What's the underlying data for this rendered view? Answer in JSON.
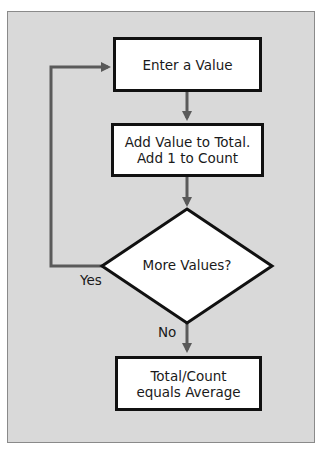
{
  "diagram": {
    "type": "flowchart",
    "colors": {
      "background": "#d9d9d9",
      "node_fill": "#ffffff",
      "node_border": "#111111",
      "arrow": "#5a5a5a",
      "text": "#1a1a1a"
    },
    "nodes": [
      {
        "id": "enter",
        "shape": "rectangle",
        "label": "Enter a Value"
      },
      {
        "id": "add",
        "shape": "rectangle",
        "label": "Add Value to Total.\nAdd 1 to Count"
      },
      {
        "id": "decision",
        "shape": "diamond",
        "label": "More Values?"
      },
      {
        "id": "result",
        "shape": "rectangle",
        "label": "Total/Count\nequals Average"
      }
    ],
    "edges": [
      {
        "from": "enter",
        "to": "add",
        "label": ""
      },
      {
        "from": "add",
        "to": "decision",
        "label": ""
      },
      {
        "from": "decision",
        "to": "enter",
        "label": "Yes"
      },
      {
        "from": "decision",
        "to": "result",
        "label": "No"
      }
    ]
  }
}
